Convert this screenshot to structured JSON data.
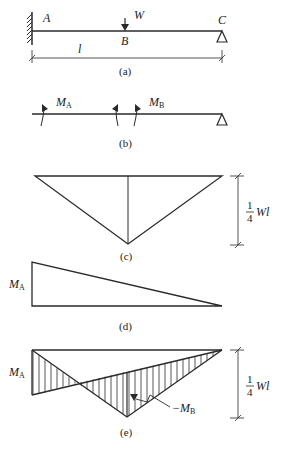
{
  "figure": {
    "a": {
      "caption": "(a)",
      "point_A": "A",
      "point_B": "B",
      "point_C": "C",
      "load": "W",
      "span": "l"
    },
    "b": {
      "caption": "(b)",
      "moment_A": "M",
      "moment_A_sub": "A",
      "moment_B": "M",
      "moment_B_sub": "B"
    },
    "c": {
      "caption": "(c)",
      "frac_num": "1",
      "frac_den": "4",
      "value": "Wl"
    },
    "d": {
      "caption": "(d)",
      "moment": "M",
      "moment_sub": "A"
    },
    "e": {
      "caption": "(e)",
      "moment_A": "M",
      "moment_A_sub": "A",
      "frac_num": "1",
      "frac_den": "4",
      "value": "Wl",
      "neg_MB": "−M",
      "neg_MB_sub": "B"
    }
  },
  "colors": {
    "line": "#2a2a2a",
    "background": "#ffffff"
  }
}
